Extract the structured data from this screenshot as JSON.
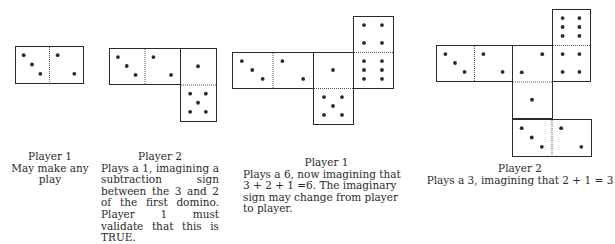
{
  "colors": {
    "ink": "#2a2a2a",
    "background": "#ffffff"
  },
  "panels": [
    {
      "player": "Player 1",
      "text": "May make any play",
      "dominoes": [
        {
          "x": 15,
          "y": 46,
          "w": 68,
          "h": 37,
          "orient": "h",
          "halves": [
            3,
            2
          ]
        }
      ]
    },
    {
      "player": "Player 2",
      "text": "Plays a 1, imagining a subtraction sign between the 3 and 2 of the first domino.  Player 1 must validate that this is TRUE.",
      "dominoes": [
        {
          "x": 109,
          "y": 48,
          "w": 71,
          "h": 36,
          "orient": "h",
          "halves": [
            3,
            2
          ]
        },
        {
          "x": 180,
          "y": 48,
          "w": 36,
          "h": 73,
          "orient": "v",
          "halves": [
            1,
            5
          ]
        }
      ]
    },
    {
      "player": "Player 1",
      "text": "Plays a 6, now imagining that 3 + 2 + 1 =6.  The imaginary sign may change from player to player.",
      "dominoes": [
        {
          "x": 232,
          "y": 52,
          "w": 81,
          "h": 36,
          "orient": "h",
          "halves": [
            3,
            2
          ]
        },
        {
          "x": 313,
          "y": 52,
          "w": 40,
          "h": 72,
          "orient": "v",
          "halves": [
            1,
            5
          ]
        },
        {
          "x": 353,
          "y": 16,
          "w": 40,
          "h": 72,
          "orient": "v",
          "halves": [
            4,
            6
          ]
        }
      ]
    },
    {
      "player": "Player 2",
      "text": "Plays a 3, imagining that 2 + 1 = 3",
      "dominoes": [
        {
          "x": 436,
          "y": 45,
          "w": 76,
          "h": 36,
          "orient": "h",
          "halves": [
            3,
            2
          ]
        },
        {
          "x": 512,
          "y": 45,
          "w": 40,
          "h": 73,
          "orient": "v",
          "halves": [
            2,
            1
          ]
        },
        {
          "x": 552,
          "y": 9,
          "w": 38,
          "h": 72,
          "orient": "v",
          "halves": [
            6,
            4
          ]
        },
        {
          "x": 512,
          "y": 119,
          "w": 79,
          "h": 37,
          "orient": "h",
          "halves": [
            3,
            2
          ]
        }
      ]
    }
  ]
}
